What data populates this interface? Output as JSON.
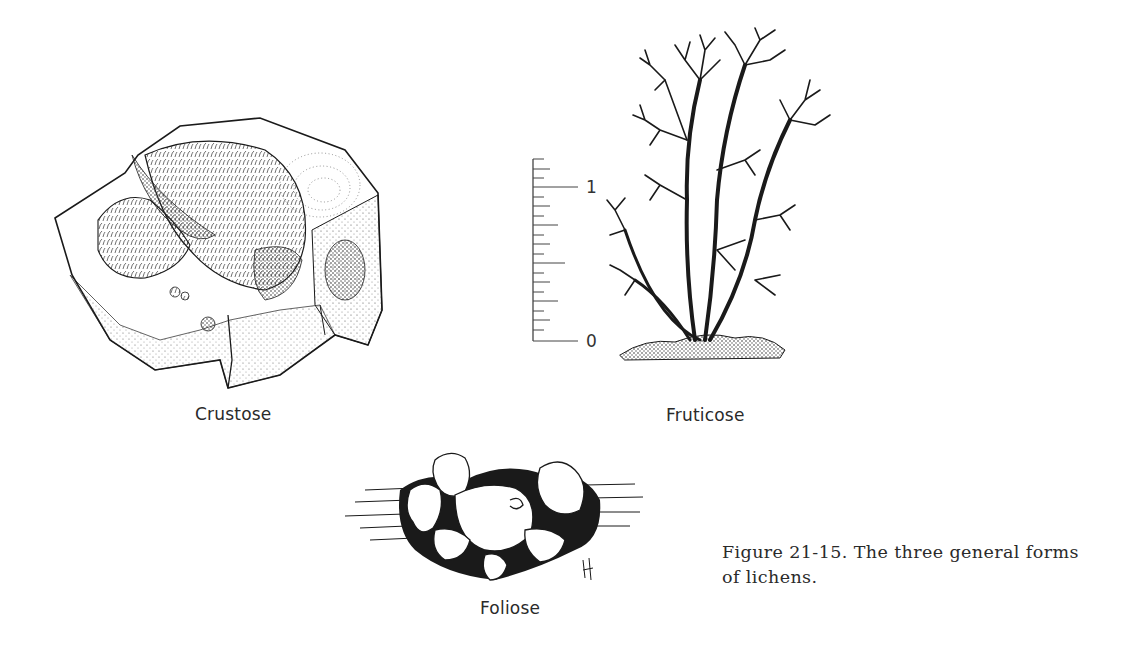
{
  "figure": {
    "caption": "Figure 21-15. The three general forms of lichens.",
    "caption_lines": [
      "Figure 21-15. The three general forms",
      "of lichens."
    ],
    "panels": [
      {
        "id": "crustose",
        "label": "Crustose",
        "depiction": "crustose lichen growing on a rock"
      },
      {
        "id": "fruticose",
        "label": "Fruticose",
        "depiction": "branching shrub-like lichen on soil"
      },
      {
        "id": "foliose",
        "label": "Foliose",
        "depiction": "leafy lobed lichen on bark"
      }
    ],
    "scale_bar": {
      "labels": [
        "1",
        "0"
      ],
      "top_label": "1",
      "bottom_label": "0",
      "minor_ticks": 20
    },
    "artist_mark": "signature initials"
  },
  "colors": {
    "ink": "#1a1a1a",
    "background": "#ffffff",
    "stipple": "#555555"
  }
}
